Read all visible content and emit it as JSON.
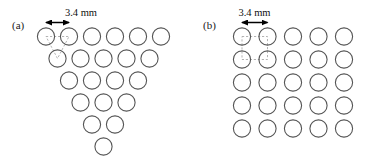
{
  "figure": {
    "background_color": "#ffffff",
    "circle_stroke_color": "#555555",
    "unit_cell_color": "#aaaaaa",
    "arrow_color": "#000000",
    "text_color": "#111111",
    "circle_radius_px": 8.6,
    "circle_stroke_width_px": 1.1
  },
  "panels": [
    {
      "id": "a",
      "label": "(a)",
      "lattice_type": "triangular",
      "arrangement_description": "inverted triangular close-packed array",
      "total_circles": 21,
      "rows": [
        {
          "count": 6,
          "cy": 36.5,
          "x_start": 46.0
        },
        {
          "count": 5,
          "cy": 58.5,
          "x_start": 57.5
        },
        {
          "count": 4,
          "cy": 80.5,
          "x_start": 69.0
        },
        {
          "count": 3,
          "cy": 102.5,
          "x_start": 80.5
        },
        {
          "count": 2,
          "cy": 124.5,
          "x_start": 92.0
        },
        {
          "count": 1,
          "cy": 146.5,
          "x_start": 103.5
        }
      ],
      "spacing_x_px": 23.0,
      "spacing_y_px": 22.0,
      "dimension": {
        "value": "3.4 mm",
        "text_x": 81.0,
        "text_y": 16.0,
        "arrow_y": 22.5,
        "arrow_x1": 46.0,
        "arrow_x2": 69.0
      },
      "unit_cell": {
        "shape": "triangle",
        "points": [
          [
            46.0,
            36.5
          ],
          [
            69.0,
            36.5
          ],
          [
            57.5,
            58.5
          ]
        ]
      }
    },
    {
      "id": "b",
      "label": "(b)",
      "lattice_type": "square",
      "arrangement_description": "square array",
      "total_circles": 25,
      "rows": [
        {
          "count": 5,
          "cy": 36.5,
          "x_start": 57.0
        },
        {
          "count": 5,
          "cy": 59.5,
          "x_start": 57.0
        },
        {
          "count": 5,
          "cy": 82.5,
          "x_start": 57.0
        },
        {
          "count": 5,
          "cy": 105.5,
          "x_start": 57.0
        },
        {
          "count": 5,
          "cy": 128.5,
          "x_start": 57.0
        }
      ],
      "spacing_x_px": 25.5,
      "spacing_y_px": 23.0,
      "dimension": {
        "value": "3.4 mm",
        "text_x": 69.5,
        "text_y": 16.0,
        "arrow_y": 22.5,
        "arrow_x1": 57.0,
        "arrow_x2": 82.5
      },
      "unit_cell": {
        "shape": "square",
        "points": [
          [
            57.0,
            36.5
          ],
          [
            82.5,
            36.5
          ],
          [
            82.5,
            59.5
          ],
          [
            57.0,
            59.5
          ]
        ]
      }
    }
  ]
}
